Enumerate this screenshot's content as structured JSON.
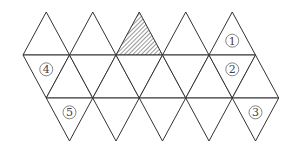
{
  "diagram": {
    "type": "icosahedron-net",
    "columns": 5,
    "hatched_face": {
      "row": "top",
      "column": 3
    },
    "labels": [
      {
        "text": "1",
        "row": "top",
        "column": 5
      },
      {
        "text": "2",
        "row": "middle-down",
        "column": 5
      },
      {
        "text": "3",
        "row": "bottom",
        "column": 5
      },
      {
        "text": "4",
        "row": "middle-down",
        "column": 1
      },
      {
        "text": "5",
        "row": "bottom",
        "column": 1
      }
    ],
    "colors": {
      "line": "#333333",
      "label": "#444444"
    }
  }
}
